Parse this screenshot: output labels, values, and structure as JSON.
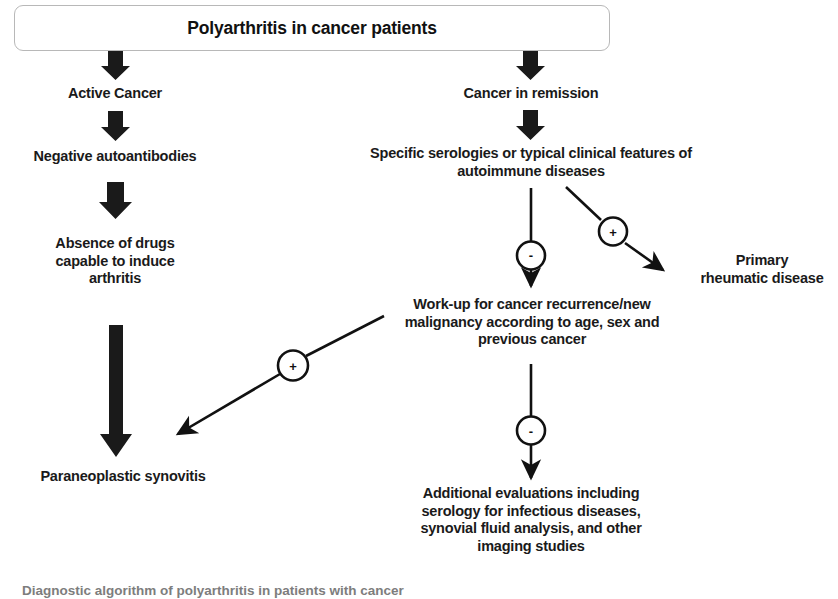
{
  "title": {
    "text": "Polyarthritis in cancer patients"
  },
  "caption": {
    "text": "Diagnostic algorithm of polyarthritis in patients with cancer"
  },
  "colors": {
    "ink": "#1a1a1a",
    "box_border": "#b8b8b8",
    "background": "#ffffff",
    "caption": "#7d7d7d"
  },
  "nodes": {
    "active_cancer": "Active Cancer",
    "negative_autoantibodies": "Negative autoantibodies",
    "absence_of_drugs": "Absence of drugs\ncapable to induce\narthritis",
    "paraneoplastic_synovitis": "Paraneoplastic synovitis",
    "cancer_in_remission": "Cancer in remission",
    "specific_serologies": "Specific serologies or typical clinical features of\nautoimmune diseases",
    "workup": "Work-up for cancer recurrence/new\nmalignancy according to age, sex and\nprevious cancer",
    "primary_rheumatic_disease": "Primary\nrheumatic disease",
    "additional_evaluations": "Additional evaluations  including\nserology  for infectious diseases,\nsynovial fluid analysis, and other\nimaging studies"
  },
  "sign_nodes": {
    "serology_negative": "-",
    "serology_positive": "+",
    "workup_negative": "-",
    "workup_positive": "+"
  },
  "edges": [
    {
      "id": "title-to-active-cancer",
      "type": "thick-down"
    },
    {
      "id": "title-to-remission",
      "type": "thick-down"
    },
    {
      "id": "active-cancer-to-autoantibodies",
      "type": "thick-down"
    },
    {
      "id": "autoantibodies-to-absence-drugs",
      "type": "thick-down"
    },
    {
      "id": "absence-drugs-to-paraneoplastic",
      "type": "thick-long-down"
    },
    {
      "id": "remission-to-serologies",
      "type": "thick-down"
    },
    {
      "id": "serologies-to-workup",
      "type": "thin-down-with-sign"
    },
    {
      "id": "serologies-to-primary-rheumatic",
      "type": "thin-diagonal-with-sign"
    },
    {
      "id": "workup-to-additional",
      "type": "thin-down-with-sign"
    },
    {
      "id": "workup-to-paraneoplastic",
      "type": "thin-diagonal-with-sign"
    }
  ]
}
